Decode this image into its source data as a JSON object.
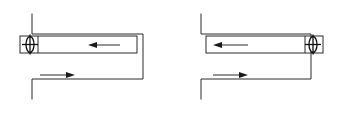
{
  "figure": {
    "background_color": "#ffffff",
    "line_color": "#2b2b2b",
    "symbol_color": "#111111",
    "width": 340,
    "height": 134,
    "panel_count": 2
  },
  "panels": [
    {
      "id": "left-panel",
      "name": "Left diagram",
      "orientation": "opens-right",
      "outline": {
        "name": "c-channel-outline",
        "description": "Bracket shaped channel profile opening toward the right",
        "points": "32,14 32,34 143,34 143,79 32,79 32,99"
      },
      "rail": {
        "name": "slider-rail",
        "description": "Thin horizontal rectangle representing the guide rail",
        "x": 20,
        "y": 36,
        "width": 117,
        "height": 17
      },
      "symbol": {
        "name": "pivot-symbol",
        "description": "Vertical oval with cross hairs marking the slider or pivot element",
        "position": "left-end",
        "cx": 30,
        "cy": 44.5,
        "rx": 4,
        "ry": 8
      },
      "divider": {
        "name": "rail-divider-line",
        "x": 38,
        "y1": 36,
        "y2": 53
      },
      "arrows": [
        {
          "name": "upper-motion-arrow",
          "direction": "left",
          "x_start": 120,
          "x_end": 88,
          "y": 45
        },
        {
          "name": "lower-motion-arrow",
          "direction": "right",
          "x_start": 40,
          "x_end": 75,
          "y": 75
        }
      ]
    },
    {
      "id": "right-panel",
      "name": "Right diagram",
      "orientation": "opens-left",
      "outline": {
        "name": "c-channel-outline",
        "description": "Bracket shaped channel profile opening toward the left, mirrored",
        "points": "201,14 201,34 311,34 311,79 201,79 201,99"
      },
      "rail": {
        "name": "slider-rail",
        "description": "Thin horizontal rectangle representing the guide rail",
        "x": 206,
        "y": 36,
        "width": 117,
        "height": 17
      },
      "symbol": {
        "name": "pivot-symbol",
        "description": "Vertical oval with cross hairs marking the slider or pivot element",
        "position": "right-end",
        "cx": 313,
        "cy": 44.5,
        "rx": 4,
        "ry": 8
      },
      "divider": {
        "name": "rail-divider-line",
        "x": 305,
        "y1": 36,
        "y2": 53
      },
      "arrows": [
        {
          "name": "upper-motion-arrow",
          "direction": "left",
          "x_start": 248,
          "x_end": 213,
          "y": 45
        },
        {
          "name": "lower-motion-arrow",
          "direction": "right",
          "x_start": 213,
          "x_end": 248,
          "y": 75
        }
      ]
    }
  ]
}
